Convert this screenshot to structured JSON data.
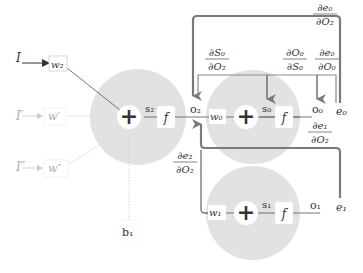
{
  "diagram": {
    "colors": {
      "neuron_fill": "#e2e2e2",
      "arrow": "#7a7a7a",
      "faded": "#c8c8c8",
      "text": "#333333"
    },
    "inputs": [
      {
        "label": "I",
        "weight": "w₂",
        "faded": false
      },
      {
        "label": "I′",
        "weight": "w′",
        "faded": true
      },
      {
        "label": "I″",
        "weight": "w″",
        "faded": true
      }
    ],
    "bias": "b₁",
    "neurons": [
      {
        "id": "n2",
        "sum_symbol": "+",
        "sum_label": "s₂",
        "activation": "f",
        "output": "o₂"
      },
      {
        "id": "n0",
        "weight": "w₀",
        "sum_symbol": "+",
        "sum_label": "s₀",
        "activation": "f",
        "output": "o₀",
        "error": "e₀"
      },
      {
        "id": "n1",
        "weight": "w₁",
        "sum_symbol": "+",
        "sum_label": "s₁",
        "activation": "f",
        "output": "o₁",
        "error": "e₁"
      }
    ],
    "gradients": {
      "de0_dO2": {
        "num": "∂e₀",
        "den": "∂O₂"
      },
      "dS0_dO2": {
        "num": "∂S₀",
        "den": "∂O₂"
      },
      "dO0_dS0": {
        "num": "∂O₀",
        "den": "∂S₀"
      },
      "de0_dO0": {
        "num": "∂e₀",
        "den": "∂O₀"
      },
      "de1_dO2": {
        "num": "∂e₁",
        "den": "∂O₂"
      },
      "de2_dO2": {
        "num": "∂e₂",
        "den": "∂O₂"
      }
    }
  }
}
